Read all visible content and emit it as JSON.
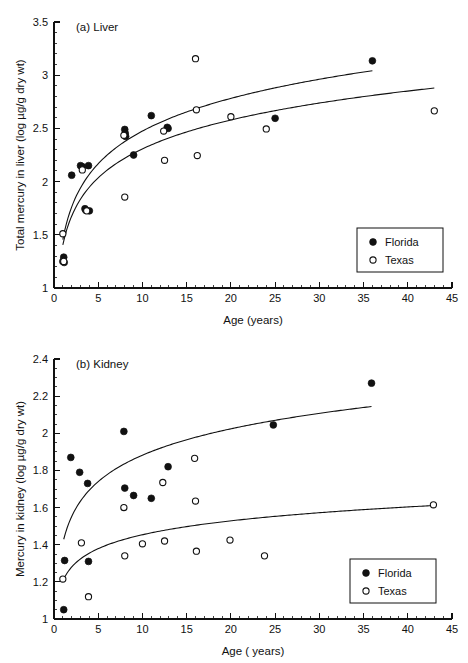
{
  "figure": {
    "background": "#ffffff",
    "ink_color": "#111111"
  },
  "chart_data": [
    {
      "id": "liver",
      "type": "scatter",
      "title": "(a) Liver",
      "xlabel": "Age (years)",
      "ylabel": "Total mercury in liver (log µg/g dry wt)",
      "xlim": [
        0,
        45
      ],
      "ylim": [
        1,
        3.5
      ],
      "xticks": [
        0,
        5,
        10,
        15,
        20,
        25,
        30,
        35,
        40,
        45
      ],
      "xticklabels": [
        "0",
        "5",
        "10",
        "15",
        "20",
        "25",
        "30",
        "35",
        "40",
        "45"
      ],
      "yticks": [
        1,
        1.5,
        2,
        2.5,
        3,
        3.5
      ],
      "yticklabels": [
        "1",
        "1.5",
        "2",
        "2.5",
        "3",
        "3.5"
      ],
      "x_minor_step": 1,
      "y_minor_step": 0.1,
      "grid": false,
      "legend_position": "lower-right",
      "series": [
        {
          "name": "Florida",
          "marker": "filled-circle",
          "color": "#111111",
          "points": [
            [
              1.0,
              1.25
            ],
            [
              1.1,
              1.29
            ],
            [
              1.15,
              1.24
            ],
            [
              2.0,
              2.06
            ],
            [
              3.0,
              2.15
            ],
            [
              3.2,
              2.14
            ],
            [
              3.9,
              2.15
            ],
            [
              3.5,
              1.745
            ],
            [
              3.6,
              1.73
            ],
            [
              4.0,
              1.725
            ],
            [
              8.0,
              2.49
            ],
            [
              8.05,
              2.455
            ],
            [
              8.1,
              2.425
            ],
            [
              9.0,
              2.25
            ],
            [
              11.0,
              2.62
            ],
            [
              12.8,
              2.51
            ],
            [
              12.9,
              2.5
            ],
            [
              25.0,
              2.595
            ],
            [
              36.0,
              3.135
            ]
          ]
        },
        {
          "name": "Texas",
          "marker": "open-circle",
          "color": "#111111",
          "points": [
            [
              1.0,
              1.51
            ],
            [
              1.1,
              1.25
            ],
            [
              3.2,
              2.11
            ],
            [
              3.7,
              1.725
            ],
            [
              7.9,
              2.435
            ],
            [
              8.0,
              1.855
            ],
            [
              12.4,
              2.475
            ],
            [
              12.5,
              2.2
            ],
            [
              16.0,
              3.155
            ],
            [
              16.1,
              2.675
            ],
            [
              16.2,
              2.245
            ],
            [
              20.0,
              2.61
            ],
            [
              24.0,
              2.495
            ],
            [
              43.0,
              2.665
            ]
          ]
        }
      ],
      "fit_curves": [
        {
          "name": "Florida",
          "form": "a + b*ln(x)",
          "a": 1.455,
          "b": 0.443,
          "x_start": 1.0,
          "x_end": 36.0
        },
        {
          "name": "Texas",
          "form": "a + b*ln(x)",
          "a": 1.405,
          "b": 0.392,
          "x_start": 1.0,
          "x_end": 43.0
        }
      ]
    },
    {
      "id": "kidney",
      "type": "scatter",
      "title": "(b) Kidney",
      "xlabel": "Age ( years)",
      "ylabel": "Mercury in kidney (log µg/g dry wt)",
      "xlim": [
        0,
        45
      ],
      "ylim": [
        1,
        2.4
      ],
      "xticks": [
        0,
        5,
        10,
        15,
        20,
        25,
        30,
        35,
        40,
        45
      ],
      "xticklabels": [
        "0",
        "5",
        "10",
        "15",
        "20",
        "25",
        "30",
        "35",
        "40",
        "45"
      ],
      "yticks": [
        1,
        1.2,
        1.4,
        1.6,
        1.8,
        2,
        2.2,
        2.4
      ],
      "yticklabels": [
        "1",
        "1.2",
        "1.4",
        "1.6",
        "1.8",
        "2",
        "2.2",
        "2.4"
      ],
      "x_minor_step": 1,
      "y_minor_step": 0.05,
      "grid": false,
      "legend_position": "lower-right",
      "series": [
        {
          "name": "Florida",
          "marker": "filled-circle",
          "color": "#111111",
          "points": [
            [
              1.1,
              1.05
            ],
            [
              1.2,
              1.315
            ],
            [
              1.9,
              1.87
            ],
            [
              2.9,
              1.79
            ],
            [
              3.8,
              1.73
            ],
            [
              3.9,
              1.31
            ],
            [
              7.9,
              2.01
            ],
            [
              8.0,
              1.705
            ],
            [
              9.0,
              1.665
            ],
            [
              11.0,
              1.65
            ],
            [
              12.9,
              1.82
            ],
            [
              24.8,
              2.045
            ],
            [
              35.9,
              2.27
            ]
          ]
        },
        {
          "name": "Texas",
          "marker": "open-circle",
          "color": "#111111",
          "points": [
            [
              1.0,
              1.215
            ],
            [
              3.1,
              1.41
            ],
            [
              3.9,
              1.12
            ],
            [
              7.9,
              1.6
            ],
            [
              8.0,
              1.34
            ],
            [
              10.0,
              1.405
            ],
            [
              12.3,
              1.735
            ],
            [
              12.5,
              1.42
            ],
            [
              15.9,
              1.865
            ],
            [
              16.0,
              1.635
            ],
            [
              16.1,
              1.365
            ],
            [
              19.9,
              1.425
            ],
            [
              23.8,
              1.34
            ],
            [
              42.9,
              1.615
            ]
          ]
        }
      ],
      "fit_curves": [
        {
          "name": "Florida",
          "form": "a + b*ln(x)",
          "a": 1.41,
          "b": 0.205,
          "x_start": 1.1,
          "x_end": 35.9
        },
        {
          "name": "Texas",
          "form": "a + b*ln(x)",
          "a": 1.205,
          "b": 0.108,
          "x_start": 1.0,
          "x_end": 42.9
        }
      ]
    }
  ],
  "legend": {
    "entries": [
      {
        "label": "Florida",
        "marker": "filled-circle"
      },
      {
        "label": "Texas",
        "marker": "open-circle"
      }
    ]
  }
}
